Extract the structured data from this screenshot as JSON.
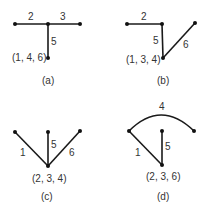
{
  "panels": [
    {
      "id": "a",
      "caption": "(a)",
      "root_label": "(1, 4, 6)",
      "edge_labels": [
        "2",
        "3",
        "5"
      ]
    },
    {
      "id": "b",
      "caption": "(b)",
      "root_label": "(1, 3, 4)",
      "edge_labels": [
        "2",
        "5",
        "6"
      ]
    },
    {
      "id": "c",
      "caption": "(c)",
      "root_label": "(2, 3, 4)",
      "edge_labels": [
        "1",
        "5",
        "6"
      ]
    },
    {
      "id": "d",
      "caption": "(d)",
      "root_label": "(2, 3, 6)",
      "edge_labels": [
        "4",
        "1",
        "5"
      ]
    }
  ]
}
